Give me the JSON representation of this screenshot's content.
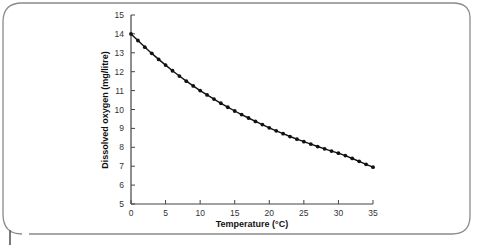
{
  "chart_data": {
    "type": "line",
    "title": "",
    "xlabel": "Temperature (°C)",
    "ylabel": "Dissolved oxygen (mg/litre)",
    "xlim": [
      0,
      35
    ],
    "ylim": [
      5,
      15
    ],
    "x_ticks": [
      0,
      5,
      10,
      15,
      20,
      25,
      30,
      35
    ],
    "y_ticks": [
      5,
      6,
      7,
      8,
      9,
      10,
      11,
      12,
      13,
      14,
      15
    ],
    "grid": false,
    "legend": null,
    "markers": "filled-circle",
    "series": [
      {
        "name": "Dissolved oxygen",
        "color": "#111111",
        "x": [
          0,
          1,
          2,
          3,
          4,
          5,
          6,
          7,
          8,
          9,
          10,
          11,
          12,
          13,
          14,
          15,
          16,
          17,
          18,
          19,
          20,
          21,
          22,
          23,
          24,
          25,
          26,
          27,
          28,
          29,
          30,
          31,
          32,
          33,
          34,
          35
        ],
        "values": [
          14.0,
          13.65,
          13.3,
          12.97,
          12.65,
          12.35,
          12.05,
          11.77,
          11.5,
          11.25,
          11.0,
          10.77,
          10.55,
          10.33,
          10.12,
          9.92,
          9.73,
          9.55,
          9.37,
          9.2,
          9.03,
          8.87,
          8.72,
          8.57,
          8.43,
          8.3,
          8.17,
          8.04,
          7.92,
          7.8,
          7.69,
          7.56,
          7.41,
          7.26,
          7.1,
          6.95
        ]
      }
    ]
  }
}
